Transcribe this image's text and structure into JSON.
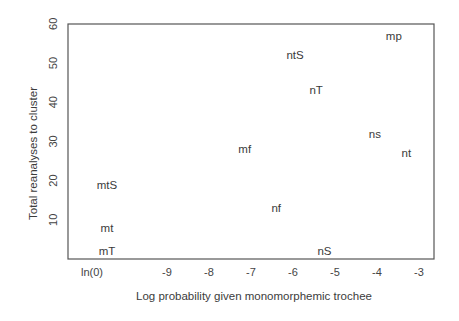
{
  "chart_data": {
    "type": "scatter",
    "title": "",
    "xlabel": "Log probability given monomorphemic trochee",
    "ylabel": "Total reanalyses to cluster",
    "xlim": [
      -10.8,
      -2.7
    ],
    "ylim": [
      0,
      60
    ],
    "grid": false,
    "legend": null,
    "marker": "text-label",
    "x_ticks": [
      {
        "value": "ln(0)",
        "label": "ln(0)"
      },
      {
        "value": -9,
        "label": "-9"
      },
      {
        "value": -8,
        "label": "-8"
      },
      {
        "value": -7,
        "label": "-7"
      },
      {
        "value": -6,
        "label": "-6"
      },
      {
        "value": -5,
        "label": "-5"
      },
      {
        "value": -4,
        "label": "-4"
      },
      {
        "value": -3,
        "label": "-3"
      }
    ],
    "y_ticks": [
      10,
      20,
      30,
      40,
      50,
      60
    ],
    "points": [
      {
        "label": "mp",
        "x": -3.6,
        "y": 57
      },
      {
        "label": "ntS",
        "x": -5.95,
        "y": 52
      },
      {
        "label": "nT",
        "x": -5.45,
        "y": 43
      },
      {
        "label": "ns",
        "x": -4.05,
        "y": 32
      },
      {
        "label": "nt",
        "x": -3.3,
        "y": 27
      },
      {
        "label": "mf",
        "x": -7.15,
        "y": 28
      },
      {
        "label": "nf",
        "x": -6.4,
        "y": 13
      },
      {
        "label": "nS",
        "x": -5.25,
        "y": 2
      },
      {
        "label": "mtS",
        "x": "ln(0)",
        "y": 19
      },
      {
        "label": "mt",
        "x": "ln(0)",
        "y": 8
      },
      {
        "label": "mT",
        "x": "ln(0)",
        "y": 2
      }
    ]
  },
  "layout": {
    "plot": {
      "left": 68,
      "top": 24,
      "right": 434,
      "bottom": 259
    },
    "x_unit_px": 42,
    "x_ref_value": -9,
    "x_ref_px": 167,
    "ln0_px": 92,
    "y_zero_px": 259,
    "y_unit_px": 3.92
  }
}
